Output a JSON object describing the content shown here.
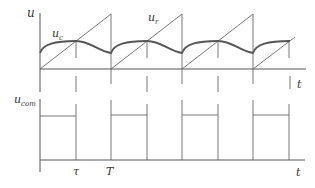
{
  "diagram": {
    "type": "waveform",
    "top_panel": {
      "y_axis_label": "u",
      "x_axis_label": "t",
      "curves": [
        {
          "name": "u_c",
          "label_main": "u",
          "label_sub": "c",
          "description": "capacitor voltage, rises to peak at tau then decays until period end"
        },
        {
          "name": "u_r",
          "label_main": "u",
          "label_sub": "r",
          "description": "sawtooth ramp voltage reset at each period T"
        }
      ]
    },
    "bottom_panel": {
      "y_axis_label_main": "u",
      "y_axis_label_sub": "com",
      "x_axis_label": "t",
      "description": "rectangular pulse train, high from 0 to tau each period"
    },
    "time_markers": [
      "τ",
      "T"
    ],
    "periods": 4
  }
}
